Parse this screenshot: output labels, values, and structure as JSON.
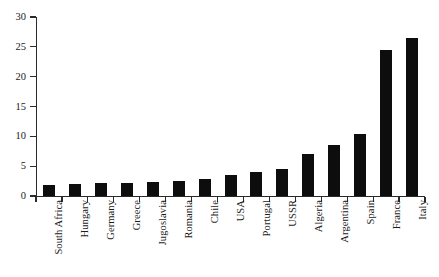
{
  "chart_data": {
    "type": "bar",
    "title": "",
    "subtitle": "",
    "xlabel": "",
    "ylabel": "",
    "ylim": [
      0,
      30
    ],
    "ytick_values": [
      0,
      5,
      10,
      15,
      20,
      25,
      30
    ],
    "ytick_labels": [
      "0",
      "5",
      "10",
      "15",
      "20",
      "25",
      "30"
    ],
    "grid": false,
    "legend": false,
    "bar_color": "#0d0d0d",
    "axis_color": "#2a2a2a",
    "categories": [
      "South Africa",
      "Hungary",
      "Germany",
      "Greece",
      "Jugoslavia",
      "Romania",
      "Chile",
      "USA",
      "Portugal",
      "USSR",
      "Algeria",
      "Argentina",
      "Spain",
      "France",
      "Italy"
    ],
    "values": [
      1.8,
      2.0,
      2.1,
      2.1,
      2.4,
      2.5,
      2.8,
      3.6,
      4.0,
      4.6,
      7.0,
      8.6,
      10.4,
      24.5,
      26.5
    ]
  }
}
